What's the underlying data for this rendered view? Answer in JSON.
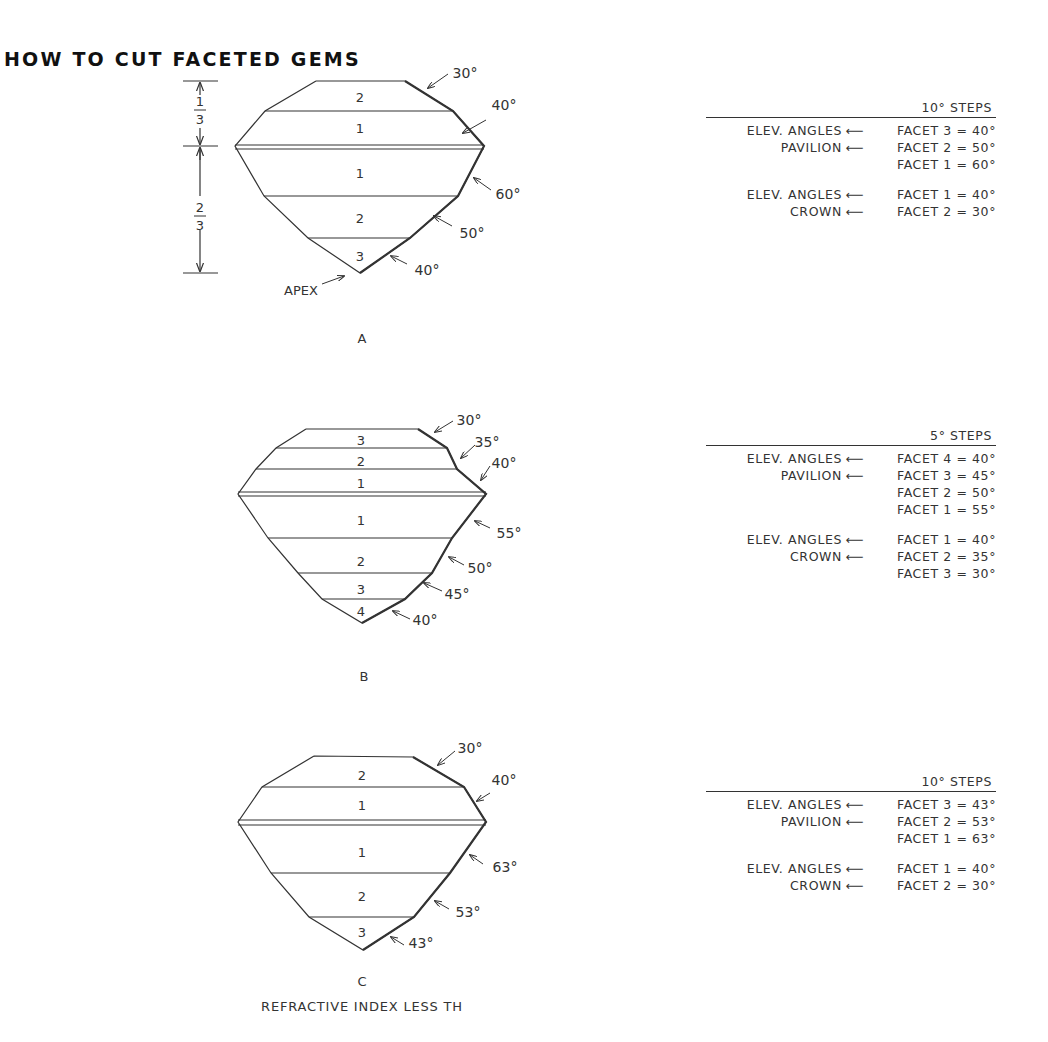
{
  "title": "HOW TO CUT FACETED GEMS",
  "dimension": {
    "top": "1/3",
    "bottom": "2/3"
  },
  "diagrams": [
    {
      "label": "A",
      "apex_label": "APEX",
      "crown_facets": [
        "2",
        "1"
      ],
      "pavilion_facets": [
        "1",
        "2",
        "3"
      ],
      "crown_angles": [
        "30°",
        "40°"
      ],
      "pavilion_angles": [
        "60°",
        "50°",
        "40°"
      ],
      "table": {
        "header": "10° STEPS",
        "groups": [
          {
            "rows": [
              {
                "label": "ELEV. ANGLES",
                "arrow": "⟵",
                "value": "FACET 3 = 40°"
              },
              {
                "label": "PAVILION",
                "arrow": "⟵",
                "value": "FACET 2 = 50°"
              },
              {
                "label": "",
                "arrow": "",
                "value": "FACET 1 = 60°"
              }
            ]
          },
          {
            "rows": [
              {
                "label": "ELEV. ANGLES",
                "arrow": "⟵",
                "value": "FACET 1 = 40°"
              },
              {
                "label": "CROWN",
                "arrow": "⟵",
                "value": "FACET 2 = 30°"
              }
            ]
          }
        ]
      }
    },
    {
      "label": "B",
      "crown_facets": [
        "3",
        "2",
        "1"
      ],
      "pavilion_facets": [
        "1",
        "2",
        "3",
        "4"
      ],
      "crown_angles": [
        "30°",
        "35°",
        "40°"
      ],
      "pavilion_angles": [
        "55°",
        "50°",
        "45°",
        "40°"
      ],
      "table": {
        "header": "5° STEPS",
        "groups": [
          {
            "rows": [
              {
                "label": "ELEV. ANGLES",
                "arrow": "⟵",
                "value": "FACET 4 = 40°"
              },
              {
                "label": "PAVILION",
                "arrow": "⟵",
                "value": "FACET 3 = 45°"
              },
              {
                "label": "",
                "arrow": "",
                "value": "FACET 2 = 50°"
              },
              {
                "label": "",
                "arrow": "",
                "value": "FACET 1 = 55°"
              }
            ]
          },
          {
            "rows": [
              {
                "label": "ELEV. ANGLES",
                "arrow": "⟵",
                "value": "FACET 1 = 40°"
              },
              {
                "label": "CROWN",
                "arrow": "⟵",
                "value": "FACET 2 = 35°"
              },
              {
                "label": "",
                "arrow": "",
                "value": "FACET 3 = 30°"
              }
            ]
          }
        ]
      }
    },
    {
      "label": "C",
      "caption": "REFRACTIVE INDEX LESS TH",
      "crown_facets": [
        "2",
        "1"
      ],
      "pavilion_facets": [
        "1",
        "2",
        "3"
      ],
      "crown_angles": [
        "30°",
        "40°"
      ],
      "pavilion_angles": [
        "63°",
        "53°",
        "43°"
      ],
      "table": {
        "header": "10° STEPS",
        "groups": [
          {
            "rows": [
              {
                "label": "ELEV. ANGLES",
                "arrow": "⟵",
                "value": "FACET 3 = 43°"
              },
              {
                "label": "PAVILION",
                "arrow": "⟵",
                "value": "FACET 2 = 53°"
              },
              {
                "label": "",
                "arrow": "",
                "value": "FACET 1 = 63°"
              }
            ]
          },
          {
            "rows": [
              {
                "label": "ELEV. ANGLES",
                "arrow": "⟵",
                "value": "FACET 1 = 40°"
              },
              {
                "label": "CROWN",
                "arrow": "⟵",
                "value": "FACET 2 = 30°"
              }
            ]
          }
        ]
      }
    }
  ]
}
